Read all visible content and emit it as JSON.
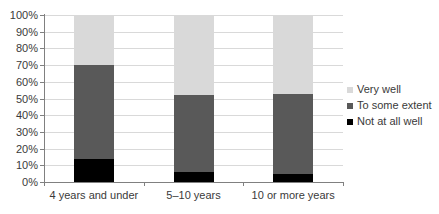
{
  "chart_data": {
    "type": "bar",
    "subtype": "stacked-percent-column",
    "categories": [
      "4 years and under",
      "5–10 years",
      "10 or more years"
    ],
    "series": [
      {
        "name": "Not at all well",
        "color": "#000000",
        "values": [
          14,
          6,
          5
        ]
      },
      {
        "name": "To some extent",
        "color": "#595959",
        "values": [
          56,
          46,
          48
        ]
      },
      {
        "name": "Very well",
        "color": "#d9d9d9",
        "values": [
          30,
          48,
          47
        ]
      }
    ],
    "y_ticks": [
      "0%",
      "10%",
      "20%",
      "30%",
      "40%",
      "50%",
      "60%",
      "70%",
      "80%",
      "90%",
      "100%"
    ],
    "ylim": [
      0,
      100
    ],
    "grid": true,
    "legend_position": "right",
    "colors": {
      "grid": "#d9d9d9",
      "axis": "#808080",
      "text": "#3a3a3a",
      "background": "#ffffff"
    }
  }
}
